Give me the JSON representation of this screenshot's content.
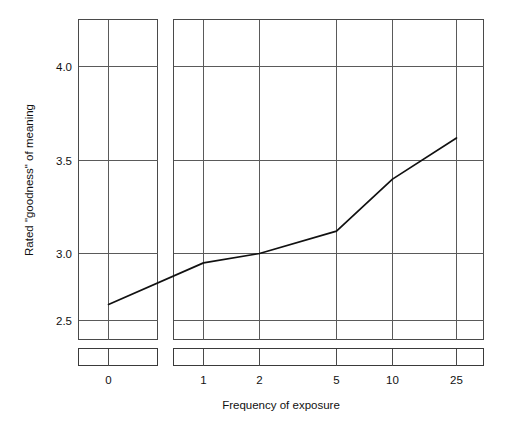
{
  "chart_data": {
    "type": "line",
    "title": "",
    "subtitle": "",
    "xlabel": "Frequency of exposure",
    "ylabel": "Rated \"goodness\" of meaning",
    "categories": [
      "0",
      "1",
      "2",
      "5",
      "10",
      "25"
    ],
    "x": [
      0,
      1,
      2,
      5,
      10,
      25
    ],
    "values": [
      2.62,
      2.93,
      3.0,
      3.12,
      3.4,
      3.62
    ],
    "series": [
      {
        "name": "Rated goodness of meaning",
        "values": [
          2.62,
          2.93,
          3.0,
          3.12,
          3.4,
          3.62
        ]
      }
    ],
    "ylim": [
      2.37,
      4.28
    ],
    "y_ticks": [
      "2.5",
      "3.0",
      "3.5",
      "4.0"
    ],
    "y_tick_values": [
      2.5,
      3.0,
      3.5,
      4.0
    ],
    "x_ticks": [
      "0",
      "1",
      "2",
      "5",
      "10",
      "25"
    ],
    "grid": true,
    "legend": "none",
    "axis_break": true
  },
  "axes": {
    "y_label": "Rated \"goodness\" of meaning",
    "x_label": "Frequency of exposure",
    "y_tick_labels": [
      "4.0",
      "3.5",
      "3.0",
      "2.5"
    ],
    "x_tick_labels_left": [
      "0"
    ],
    "x_tick_labels_right": [
      "1",
      "2",
      "5",
      "10",
      "25"
    ]
  },
  "colors": {
    "line": "#111111",
    "grid": "#5a5a5a",
    "frame": "#4a4a4a",
    "background": "#ffffff",
    "text": "#111111"
  }
}
